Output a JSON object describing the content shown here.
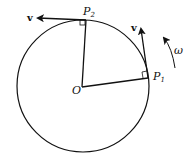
{
  "diagram": {
    "center_label": "O",
    "points": [
      {
        "label": "P",
        "sub": "1"
      },
      {
        "label": "P",
        "sub": "2"
      }
    ],
    "velocity_label": "v",
    "angular_velocity_label": "ω",
    "colors": {
      "stroke": "#111111",
      "background": "#ffffff"
    }
  }
}
